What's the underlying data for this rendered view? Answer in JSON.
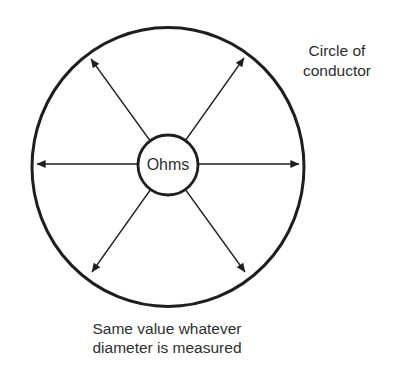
{
  "diagram": {
    "center_label": "Ohms",
    "top_right_label": "Circle of\nconductor",
    "caption": "Same value whatever\ndiameter is measured"
  },
  "colors": {
    "line": "#1e1e1e",
    "text": "#2e2e2e",
    "background": "#ffffff"
  }
}
